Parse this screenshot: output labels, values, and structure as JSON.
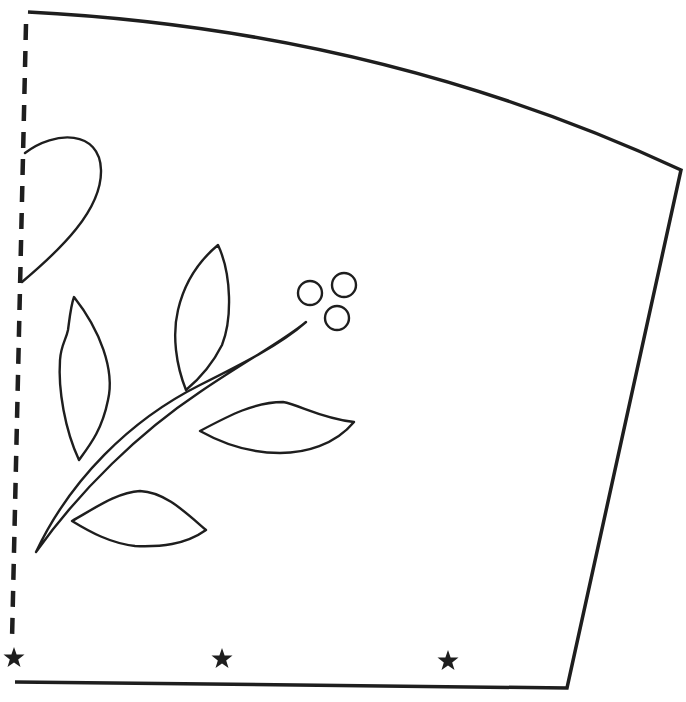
{
  "pattern": {
    "type": "sewing-template",
    "colors": {
      "line": "#1e1e1e",
      "background": "#ffffff"
    },
    "outline": {
      "top_left": [
        28,
        12
      ],
      "top_right": [
        681,
        170
      ],
      "bottom_right": [
        567,
        688
      ],
      "bottom_left": [
        15,
        682
      ]
    },
    "fold_line": {
      "style": "dashed",
      "x_top": 26,
      "x_bottom": 12,
      "y_top": 24,
      "y_bottom": 640
    },
    "notch_markers": [
      {
        "icon": "star-icon",
        "x": 14,
        "y": 658
      },
      {
        "icon": "star-icon",
        "x": 222,
        "y": 659
      },
      {
        "icon": "star-icon",
        "x": 448,
        "y": 661
      }
    ],
    "motif": {
      "name": "leaf-branch-with-berries",
      "berries": [
        {
          "cx": 310,
          "cy": 293,
          "r": 12
        },
        {
          "cx": 344,
          "cy": 285,
          "r": 12
        },
        {
          "cx": 337,
          "cy": 318,
          "r": 12
        }
      ],
      "leaves": 4
    }
  }
}
